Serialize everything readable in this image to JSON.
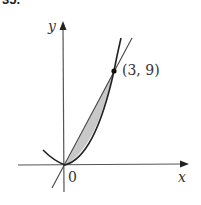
{
  "problem_number": "35.",
  "axes": {
    "x_label": "x",
    "y_label": "y",
    "origin_label": "0"
  },
  "curves": [
    {
      "name": "parabola",
      "equation": "y = x^2"
    },
    {
      "name": "line",
      "equation": "y = 3x"
    }
  ],
  "intersection_point": {
    "label": "(3, 9)",
    "x": 3,
    "y": 9
  },
  "shaded_region": "between y = 3x and y = x^2 from x = 0 to x = 3",
  "colors": {
    "shade": "#c8c8c8",
    "ink": "#222222"
  }
}
